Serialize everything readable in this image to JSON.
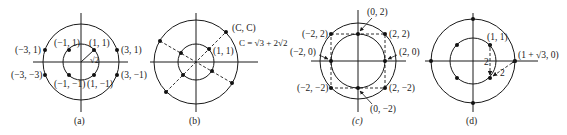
{
  "figure": {
    "panels": [
      {
        "id": "a",
        "caption": "(a)",
        "labels": {
          "p_m3_1": "(−3, 1)",
          "p_3_1": "(3, 1)",
          "p_m3_m1": "(−3, −3)",
          "p_3_m1": "(3, −1)",
          "p_m1_1": "(−1, 1)",
          "p_1_1": "(1, 1)",
          "p_m1_m1": "(−1, −1)",
          "p_1_m1": "(1, −1)",
          "radius": "√2"
        }
      },
      {
        "id": "b",
        "caption": "(b)",
        "labels": {
          "p_c_c": "(C, C)",
          "p_1_1": "(1, 1)",
          "c_def": "C = √3 + 2√2"
        }
      },
      {
        "id": "c",
        "caption": "(c)",
        "labels": {
          "p_0_2": "(0, 2)",
          "p_m2_2": "(−2, 2)",
          "p_2_2": "(2, 2)",
          "p_m2_0": "(−2, 0)",
          "p_2_0": "(2, 0)",
          "p_m2_m2": "(−2, −2)",
          "p_2_m2": "(2, −2)",
          "p_0_m2": "(0, −2)"
        }
      },
      {
        "id": "d",
        "caption": "(d)",
        "labels": {
          "p_1_1": "(1, 1)",
          "p_outer": "(1 + √3, 0)",
          "dist_vertical": "2",
          "dist_diag": "2"
        }
      }
    ]
  }
}
